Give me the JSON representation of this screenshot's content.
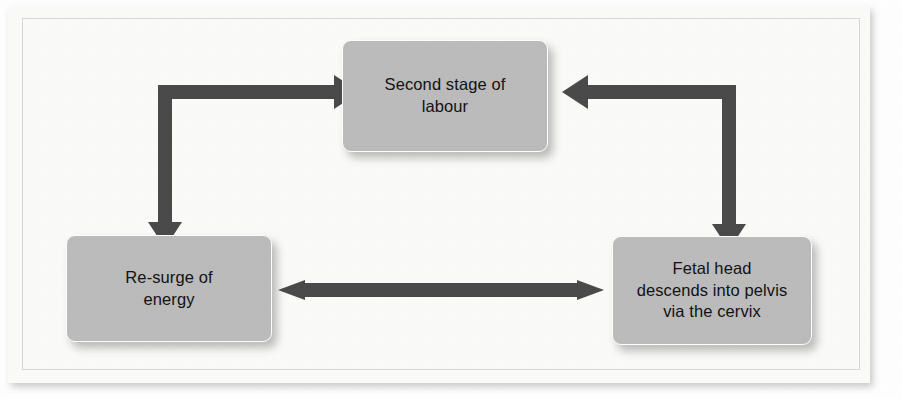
{
  "figure": {
    "type": "cycle-flowchart",
    "orientation": "triangular-cycle",
    "background_color": "#fbfbfa",
    "node_fill_color": "#bcbcbc",
    "node_text_color": "#121212",
    "arrow_color": "#4a4a4a",
    "frame_color": "#d8d8d6"
  },
  "nodes": [
    {
      "id": "second-stage",
      "label": "Second stage of\nlabour",
      "position": "top-center"
    },
    {
      "id": "resurge",
      "label": "Re-surge of\nenergy",
      "position": "bottom-left"
    },
    {
      "id": "fetal-head",
      "label": "Fetal head\ndescends into pelvis\nvia the cervix",
      "position": "bottom-right"
    }
  ],
  "connectors": [
    {
      "id": "left-elbow",
      "from": "resurge",
      "to": "second-stage",
      "style": "elbow",
      "heads": "double",
      "head_directions": [
        "right",
        "down"
      ]
    },
    {
      "id": "right-elbow",
      "from": "fetal-head",
      "to": "second-stage",
      "style": "elbow",
      "heads": "double",
      "head_directions": [
        "left",
        "down"
      ]
    },
    {
      "id": "bottom-link",
      "from": "resurge",
      "to": "fetal-head",
      "style": "straight-horizontal",
      "heads": "double",
      "head_directions": [
        "left",
        "right"
      ]
    }
  ]
}
